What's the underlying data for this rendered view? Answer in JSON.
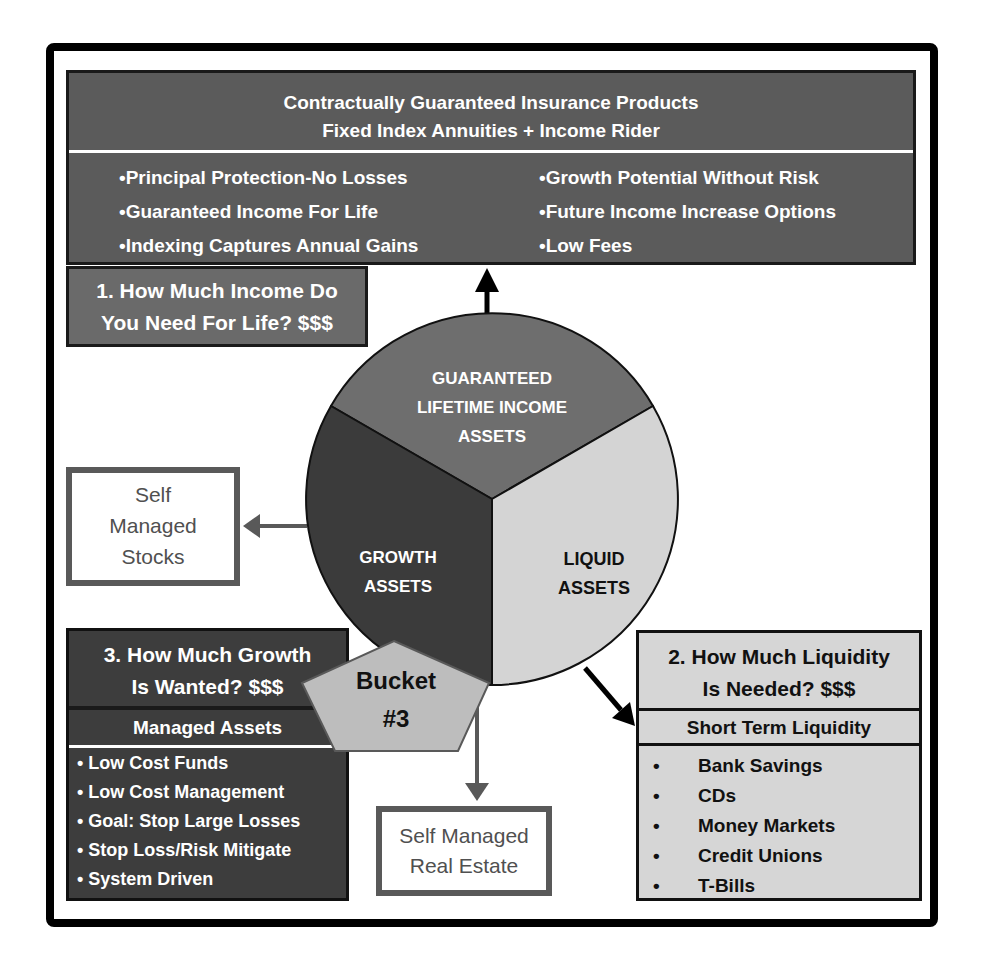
{
  "top_box": {
    "title_line1": "Contractually Guaranteed Insurance Products",
    "title_line2": "Fixed Index Annuities + Income Rider",
    "bullets_left": [
      "•Principal Protection-No Losses",
      "•Guaranteed Income For  Life",
      "•Indexing Captures Annual Gains"
    ],
    "bullets_right": [
      "•Growth Potential Without Risk",
      "•Future Income Increase Options",
      "•Low Fees"
    ],
    "color": "#5b5b5b"
  },
  "question1": {
    "line1": "1. How Much Income Do",
    "line2": "You Need For Life? $$$"
  },
  "pie": {
    "segments": [
      {
        "label_lines": [
          "GUARANTEED",
          "LIFETIME INCOME",
          "ASSETS"
        ],
        "color": "#6e6e6e",
        "text_color": "#ffffff"
      },
      {
        "label_lines": [
          "GROWTH",
          "ASSETS"
        ],
        "color": "#3b3b3b",
        "text_color": "#ffffff"
      },
      {
        "label_lines": [
          "LIQUID",
          "ASSETS"
        ],
        "color": "#d4d4d4",
        "text_color": "#111111"
      }
    ]
  },
  "stocks_box": {
    "lines": [
      "Self",
      "Managed",
      "Stocks"
    ]
  },
  "question3": {
    "line1": "3. How Much Growth",
    "line2": "Is Wanted? $$$",
    "subtitle": "Managed Assets",
    "items": [
      "• Low Cost Funds",
      "• Low Cost Management",
      "• Goal: Stop Large Losses",
      "• Stop Loss/Risk Mitigate",
      "• System Driven"
    ]
  },
  "bucket": {
    "line1": "Bucket",
    "line2": "#3",
    "color": "#bdbdbd"
  },
  "realestate_box": {
    "line1": "Self Managed",
    "line2": "Real Estate"
  },
  "question2": {
    "line1": "2. How Much Liquidity",
    "line2": "Is Needed? $$$",
    "subtitle": "Short Term Liquidity",
    "bullet": "•",
    "items": [
      "Bank Savings",
      "CDs",
      "Money Markets",
      "Credit Unions",
      "T-Bills"
    ]
  }
}
